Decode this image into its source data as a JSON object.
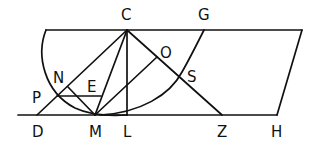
{
  "diagram": {
    "type": "geometric-construction",
    "labels": {
      "C": "C",
      "G": "G",
      "O": "O",
      "N": "N",
      "E": "E",
      "S": "S",
      "P": "P",
      "D": "D",
      "M": "M",
      "L": "L",
      "Z": "Z",
      "H": "H"
    },
    "colors": {
      "stroke": "#111111",
      "background": "#ffffff"
    }
  }
}
